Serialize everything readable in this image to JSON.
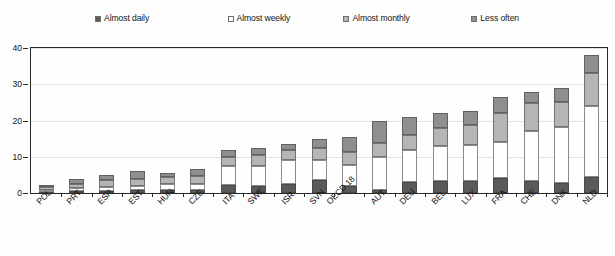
{
  "legend": {
    "items": [
      {
        "label": "Almost daily",
        "color": "#5a5a5a",
        "name": "legend-almost-daily"
      },
      {
        "label": "Almost weekly",
        "color": "#ffffff",
        "name": "legend-almost-weekly"
      },
      {
        "label": "Almost monthly",
        "color": "#b5b5b5",
        "name": "legend-almost-monthly"
      },
      {
        "label": "Less often",
        "color": "#8f8f8f",
        "name": "legend-less-often"
      }
    ]
  },
  "chart_data": {
    "type": "bar",
    "stacked": true,
    "title": "",
    "xlabel": "",
    "ylabel": "",
    "ylim": [
      0,
      40
    ],
    "yticks": [
      0,
      10,
      20,
      30,
      40
    ],
    "grid": true,
    "legend_position": "top",
    "categories": [
      "POL",
      "PRT",
      "ESP",
      "EST",
      "HUN",
      "CZE",
      "ITA",
      "SWE",
      "ISR",
      "SVN",
      "OECD 18",
      "AUT",
      "DEU",
      "BEL",
      "LUX",
      "FRA",
      "CHE",
      "DNK",
      "NLD"
    ],
    "series": [
      {
        "name": "Almost daily",
        "color": "#5a5a5a",
        "values": [
          0.3,
          0.5,
          0.5,
          0.7,
          0.8,
          0.8,
          2.1,
          2.0,
          2.6,
          3.5,
          1.8,
          0.9,
          3.0,
          3.4,
          3.2,
          4.2,
          3.2,
          2.7,
          4.5
        ]
      },
      {
        "name": "Almost weekly",
        "color": "#ffffff",
        "values": [
          0.6,
          0.8,
          1.1,
          1.3,
          1.6,
          1.8,
          5.4,
          5.5,
          6.4,
          5.5,
          6.0,
          9.0,
          9.0,
          9.5,
          10.0,
          10.0,
          14.0,
          15.5,
          19.5
        ]
      },
      {
        "name": "Almost monthly",
        "color": "#b5b5b5",
        "values": [
          0.7,
          1.3,
          1.9,
          2.0,
          1.9,
          2.2,
          2.5,
          3.0,
          3.0,
          3.5,
          3.5,
          4.0,
          4.0,
          5.0,
          5.5,
          8.0,
          7.5,
          7.0,
          9.0
        ]
      },
      {
        "name": "Less often",
        "color": "#8f8f8f",
        "values": [
          0.4,
          1.4,
          1.5,
          2.0,
          1.2,
          1.7,
          2.0,
          2.0,
          1.5,
          2.5,
          4.2,
          6.1,
          5.0,
          4.1,
          3.8,
          4.3,
          3.3,
          3.8,
          5.0
        ]
      }
    ],
    "totals": [
      2.0,
      4.0,
      5.0,
      6.0,
      5.5,
      6.5,
      12.0,
      12.5,
      13.5,
      15.0,
      15.5,
      20.0,
      21.0,
      22.0,
      22.5,
      26.5,
      28.0,
      29.0,
      38.0
    ]
  }
}
